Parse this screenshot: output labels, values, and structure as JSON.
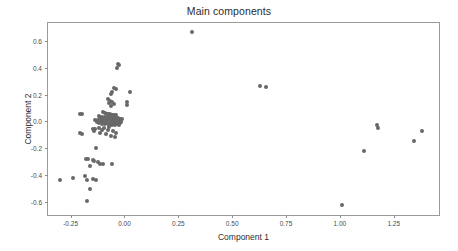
{
  "figure": {
    "title": "Main components",
    "point_color": "#686868",
    "frame_color": "#9a9a9a",
    "background": "#ffffff"
  },
  "chart_data": {
    "type": "scatter",
    "title": "Main components",
    "xlabel": "Component 1",
    "ylabel": "Component 2",
    "grid": false,
    "legend": false,
    "xlim": [
      -0.355,
      1.46
    ],
    "ylim": [
      -0.7,
      0.735
    ],
    "xticks": [
      -0.25,
      0.0,
      0.25,
      0.5,
      0.75,
      1.0,
      1.25
    ],
    "xticklabels": [
      "-0.25",
      "0.00",
      "0.25",
      "0.50",
      "0.75",
      "1.00",
      "1.25"
    ],
    "yticks": [
      0.6,
      0.4,
      0.2,
      0.0,
      -0.2,
      -0.4,
      -0.6
    ],
    "yticklabels": [
      "0.6",
      "0.4",
      "0.2",
      "0.0",
      "-0.2",
      "-0.4",
      "-0.6"
    ],
    "marker": "circle",
    "marker_size": 4,
    "series": [
      {
        "name": "samples",
        "color": "#686868",
        "points": [
          [
            0.315,
            0.668
          ],
          [
            -0.03,
            0.425
          ],
          [
            -0.027,
            0.418
          ],
          [
            -0.035,
            0.4
          ],
          [
            -0.048,
            0.252
          ],
          [
            -0.04,
            0.238
          ],
          [
            -0.057,
            0.222
          ],
          [
            0.025,
            0.22
          ],
          [
            -0.062,
            0.205
          ],
          [
            -0.075,
            0.168
          ],
          [
            -0.068,
            0.152
          ],
          [
            -0.058,
            0.148
          ],
          [
            0.012,
            0.145
          ],
          [
            -0.07,
            0.138
          ],
          [
            -0.05,
            0.132
          ],
          [
            0.01,
            0.12
          ],
          [
            -0.063,
            0.118
          ],
          [
            -0.205,
            0.058
          ],
          [
            -0.196,
            0.055
          ],
          [
            -0.1,
            0.07
          ],
          [
            -0.09,
            0.062
          ],
          [
            -0.082,
            0.058
          ],
          [
            -0.075,
            0.055
          ],
          [
            -0.068,
            0.052
          ],
          [
            -0.062,
            0.048
          ],
          [
            -0.058,
            0.045
          ],
          [
            -0.052,
            0.048
          ],
          [
            -0.048,
            0.042
          ],
          [
            -0.045,
            0.05
          ],
          [
            -0.042,
            0.038
          ],
          [
            -0.038,
            0.045
          ],
          [
            -0.118,
            0.04
          ],
          [
            -0.112,
            0.022
          ],
          [
            -0.105,
            0.03
          ],
          [
            -0.098,
            0.018
          ],
          [
            -0.092,
            0.035
          ],
          [
            -0.088,
            0.012
          ],
          [
            -0.082,
            0.028
          ],
          [
            -0.078,
            0.008
          ],
          [
            -0.072,
            0.03
          ],
          [
            -0.068,
            0.015
          ],
          [
            -0.064,
            0.022
          ],
          [
            -0.06,
            0.005
          ],
          [
            -0.056,
            0.028
          ],
          [
            -0.052,
            0.012
          ],
          [
            -0.048,
            0.018
          ],
          [
            -0.044,
            0.002
          ],
          [
            -0.04,
            0.022
          ],
          [
            -0.036,
            0.01
          ],
          [
            -0.032,
            0.026
          ],
          [
            -0.028,
            0.015
          ],
          [
            -0.024,
            0.005
          ],
          [
            -0.02,
            0.018
          ],
          [
            -0.016,
            0.01
          ],
          [
            -0.012,
            0.02
          ],
          [
            -0.135,
            0.012
          ],
          [
            -0.128,
            -0.005
          ],
          [
            -0.122,
            0.008
          ],
          [
            -0.116,
            -0.012
          ],
          [
            -0.11,
            0.002
          ],
          [
            -0.104,
            -0.018
          ],
          [
            -0.098,
            -0.008
          ],
          [
            -0.092,
            -0.022
          ],
          [
            -0.086,
            -0.002
          ],
          [
            -0.08,
            -0.015
          ],
          [
            -0.074,
            -0.025
          ],
          [
            -0.068,
            -0.01
          ],
          [
            -0.062,
            -0.02
          ],
          [
            -0.056,
            -0.03
          ],
          [
            -0.05,
            -0.012
          ],
          [
            -0.044,
            -0.025
          ],
          [
            -0.038,
            -0.008
          ],
          [
            -0.032,
            -0.018
          ],
          [
            -0.026,
            -0.03
          ],
          [
            -0.02,
            -0.015
          ],
          [
            -0.014,
            -0.005
          ],
          [
            -0.148,
            -0.055
          ],
          [
            -0.142,
            -0.075
          ],
          [
            -0.136,
            -0.06
          ],
          [
            -0.12,
            -0.052
          ],
          [
            -0.112,
            -0.085
          ],
          [
            -0.105,
            -0.068
          ],
          [
            -0.095,
            -0.048
          ],
          [
            -0.088,
            -0.095
          ],
          [
            -0.078,
            -0.062
          ],
          [
            -0.07,
            -0.045
          ],
          [
            -0.205,
            -0.085
          ],
          [
            -0.196,
            -0.098
          ],
          [
            -0.062,
            -0.108
          ],
          [
            -0.052,
            -0.072
          ],
          [
            -0.045,
            -0.118
          ],
          [
            -0.038,
            -0.088
          ],
          [
            -0.132,
            -0.2
          ],
          [
            -0.178,
            -0.278
          ],
          [
            -0.17,
            -0.282
          ],
          [
            -0.148,
            -0.288
          ],
          [
            -0.14,
            -0.295
          ],
          [
            -0.122,
            -0.305
          ],
          [
            -0.112,
            -0.318
          ],
          [
            -0.158,
            -0.332
          ],
          [
            -0.098,
            -0.318
          ],
          [
            -0.06,
            -0.322
          ],
          [
            -0.3,
            -0.438
          ],
          [
            -0.238,
            -0.425
          ],
          [
            -0.182,
            -0.405
          ],
          [
            -0.172,
            -0.44
          ],
          [
            -0.148,
            -0.428
          ],
          [
            -0.132,
            -0.442
          ],
          [
            -0.16,
            -0.508
          ],
          [
            -0.175,
            -0.598
          ],
          [
            0.63,
            0.265
          ],
          [
            0.658,
            0.255
          ],
          [
            1.01,
            -0.622
          ],
          [
            1.112,
            -0.222
          ],
          [
            1.172,
            -0.03
          ],
          [
            1.178,
            -0.048
          ],
          [
            1.345,
            -0.148
          ],
          [
            1.382,
            -0.07
          ]
        ]
      }
    ]
  }
}
